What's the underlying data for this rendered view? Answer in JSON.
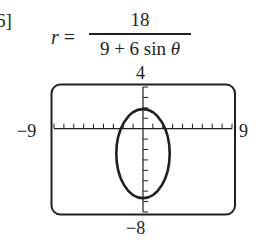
{
  "problem": {
    "number_fragment": "6]",
    "equation": {
      "lhs_var": "r",
      "equals": "=",
      "numerator": "18",
      "denominator_prefix": "9 + 6 sin ",
      "denominator_theta": "θ"
    }
  },
  "chart_data": {
    "type": "line",
    "window": {
      "xmin": -9,
      "xmax": 9,
      "ymin": -8,
      "ymax": 4,
      "xscl": 1,
      "yscl": 1
    },
    "tick_labels": {
      "x_left": "−9",
      "x_right": "9",
      "y_top": "4",
      "y_bottom": "−8"
    },
    "grid": false,
    "legend": null,
    "series": [
      {
        "name": "ellipse",
        "shape": "ellipse",
        "center": [
          0,
          -2.4
        ],
        "x_extent": [
          -1.79,
          1.79
        ],
        "y_extent": [
          -6,
          1.2
        ],
        "vertices": [
          [
            0,
            1.2
          ],
          [
            0,
            -6
          ]
        ]
      }
    ],
    "xlabel": "",
    "ylabel": ""
  },
  "labels": {
    "ymax": "4",
    "xmin": "−9",
    "xmax": "9",
    "ymin": "−8"
  },
  "colors": {
    "ink": "#231f20",
    "background": "#ffffff"
  }
}
